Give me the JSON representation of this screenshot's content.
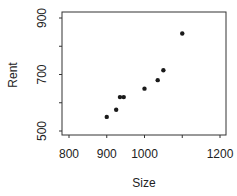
{
  "chart_data": {
    "type": "scatter",
    "title": "",
    "xlabel": "Size",
    "ylabel": "Rent",
    "xlim": [
      770,
      1220
    ],
    "ylim": [
      490,
      920
    ],
    "x_ticks": [
      800,
      900,
      1000,
      1100,
      1200
    ],
    "x_tick_labels": [
      "800",
      "900",
      "1000",
      "",
      "1200"
    ],
    "y_ticks": [
      500,
      600,
      700,
      800,
      900
    ],
    "y_tick_labels": [
      "500",
      "",
      "700",
      "",
      "900"
    ],
    "grid": false,
    "legend": null,
    "points": [
      {
        "x": 900,
        "y": 550
      },
      {
        "x": 925,
        "y": 575
      },
      {
        "x": 935,
        "y": 620
      },
      {
        "x": 945,
        "y": 620
      },
      {
        "x": 1000,
        "y": 650
      },
      {
        "x": 1035,
        "y": 680
      },
      {
        "x": 1050,
        "y": 715
      },
      {
        "x": 1100,
        "y": 845
      }
    ],
    "marker_color": "#1a1a1a"
  }
}
